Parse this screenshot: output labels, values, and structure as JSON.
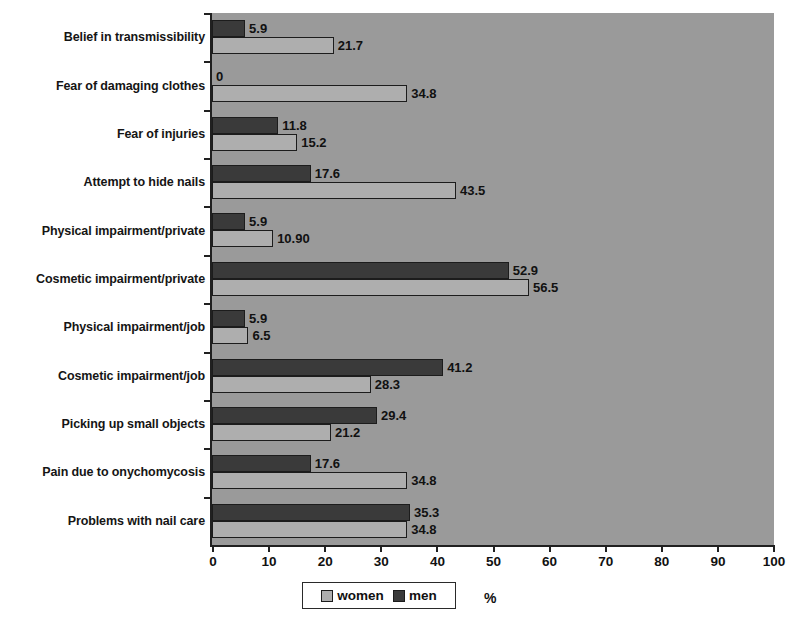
{
  "chart_data": {
    "type": "bar",
    "orientation": "horizontal",
    "title": "",
    "xlabel": "%",
    "ylabel": "",
    "xlim": [
      0,
      100
    ],
    "xticks": [
      0,
      10,
      20,
      30,
      40,
      50,
      60,
      70,
      80,
      90,
      100
    ],
    "grid": false,
    "legend_position": "bottom",
    "categories": [
      "Belief in transmissibility",
      "Fear of damaging clothes",
      "Fear of injuries",
      "Attempt to hide nails",
      "Physical impairment/private",
      "Cosmetic impairment/private",
      "Physical impairment/job",
      "Cosmetic impairment/job",
      "Picking up small objects",
      "Pain due to onychomycosis",
      "Problems with nail care"
    ],
    "series": [
      {
        "name": "men",
        "color": "#3a3a3a",
        "values": [
          5.9,
          0,
          11.8,
          17.6,
          5.9,
          52.9,
          5.9,
          41.2,
          29.4,
          17.6,
          35.3
        ],
        "labels": [
          "5.9",
          "0",
          "11.8",
          "17.6",
          "5.9",
          "52.9",
          "5.9",
          "41.2",
          "29.4",
          "17.6",
          "35.3"
        ]
      },
      {
        "name": "women",
        "color": "#aeaeae",
        "values": [
          21.7,
          34.8,
          15.2,
          43.5,
          10.9,
          56.5,
          6.5,
          28.3,
          21.2,
          34.8,
          34.8
        ],
        "labels": [
          "21.7",
          "34.8",
          "15.2",
          "43.5",
          "10.90",
          "56.5",
          "6.5",
          "28.3",
          "21.2",
          "34.8",
          "34.8"
        ]
      }
    ]
  },
  "legend": {
    "items": [
      {
        "label": "women",
        "swatch": "women"
      },
      {
        "label": "men",
        "swatch": "men"
      }
    ]
  },
  "colors": {
    "plot_background": "#9a9a9a",
    "page_background": "#ffffff",
    "axis": "#202020",
    "men": "#3a3a3a",
    "women": "#aeaeae"
  }
}
